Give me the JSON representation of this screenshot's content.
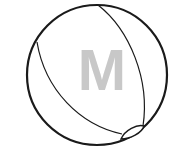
{
  "icon": {
    "name": "beach-ball",
    "letter": "M",
    "colors": {
      "stroke": "#1a1a1a",
      "letter": "#c8c8c8",
      "background": "#ffffff"
    }
  }
}
